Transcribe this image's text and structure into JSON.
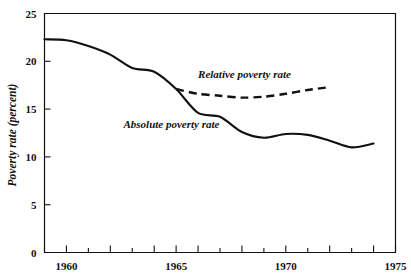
{
  "chart_data": {
    "type": "line",
    "title": "",
    "xlabel": "",
    "ylabel": "Poverty rate (percent)",
    "xlim": [
      1959,
      1975
    ],
    "ylim": [
      0,
      25
    ],
    "grid": false,
    "legend_position": "inline-annotations",
    "x_ticks_all": [
      1959,
      1960,
      1961,
      1962,
      1963,
      1964,
      1965,
      1966,
      1967,
      1968,
      1969,
      1970,
      1971,
      1972,
      1973,
      1974,
      1975
    ],
    "x_tick_labels": [
      "1960",
      "1965",
      "1970",
      "1975"
    ],
    "x_tick_label_values": [
      1960,
      1965,
      1970,
      1975
    ],
    "y_ticks": [
      0,
      5,
      10,
      15,
      20,
      25
    ],
    "y_tick_labels": [
      "0",
      "5",
      "10",
      "15",
      "20",
      "25"
    ],
    "series": [
      {
        "name": "Absolute poverty rate",
        "style": "solid",
        "annotation": "Absolute poverty rate",
        "x": [
          1959,
          1960,
          1961,
          1962,
          1963,
          1964,
          1965,
          1966,
          1967,
          1968,
          1969,
          1970,
          1971,
          1972,
          1973,
          1974
        ],
        "values": [
          22.3,
          22.2,
          21.6,
          20.7,
          19.3,
          18.9,
          17.1,
          14.6,
          14.2,
          12.6,
          12.0,
          12.4,
          12.3,
          11.7,
          11.0,
          11.4
        ]
      },
      {
        "name": "Relative poverty rate",
        "style": "dashed",
        "annotation": "Relative poverty rate",
        "x": [
          1965,
          1966,
          1967,
          1968,
          1969,
          1970,
          1971,
          1972
        ],
        "values": [
          17.1,
          16.6,
          16.4,
          16.2,
          16.3,
          16.6,
          17.0,
          17.3
        ]
      }
    ],
    "annotations": [
      {
        "text": "Relative poverty rate",
        "x": 1966.0,
        "y": 18.3
      },
      {
        "text": "Absolute poverty rate",
        "x": 1962.6,
        "y": 13.0
      }
    ],
    "colors": {
      "ink": "#111111",
      "background": "#ffffff"
    }
  }
}
